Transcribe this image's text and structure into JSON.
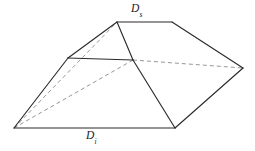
{
  "figure": {
    "kind": "truncated-pyramid-frustum-perspective",
    "background_color": "#ffffff",
    "solid_edge_color": "#2b2b2b",
    "hidden_edge_color": "#8a8a8a",
    "label_color": "#1a1a1a",
    "width": 255,
    "height": 151
  },
  "labels": {
    "top": {
      "base": "D",
      "subscript": "s",
      "full": "Ds",
      "meaning": "superior-top-diameter"
    },
    "bottom": {
      "base": "D",
      "subscript": "i",
      "full": "Di",
      "meaning": "inferior-bottom-diameter"
    }
  },
  "geometry": {
    "vertices": {
      "bottom_left": [
        14,
        128
      ],
      "bottom_right": [
        175,
        128
      ],
      "right_far": [
        243,
        68
      ],
      "left_mid": [
        68,
        58
      ],
      "center_junction": [
        133,
        60
      ],
      "top_left_apex": [
        117,
        22
      ],
      "top_right_apex": [
        172,
        22
      ]
    },
    "solid_edges": [
      {
        "name": "bottom-front-edge",
        "from": "bottom_left",
        "to": "bottom_right"
      },
      {
        "name": "bottom-right-edge",
        "from": "bottom_right",
        "to": "right_far"
      },
      {
        "name": "left-slope-edge",
        "from": "bottom_left",
        "to": "left_mid"
      },
      {
        "name": "left-top-ridge",
        "from": "left_mid",
        "to": "top_left_apex"
      },
      {
        "name": "top-edge",
        "from": "top_left_apex",
        "to": "top_right_apex"
      },
      {
        "name": "right-top-ridge",
        "from": "top_right_apex",
        "to": "right_far"
      },
      {
        "name": "mid-horizontal-edge",
        "from": "left_mid",
        "to": "center_junction"
      },
      {
        "name": "center-to-top-left",
        "from": "center_junction",
        "to": "top_left_apex"
      },
      {
        "name": "center-to-bottom-right",
        "from": "center_junction",
        "to": "bottom_right"
      }
    ],
    "hidden_edges": [
      {
        "name": "hidden-diagonal-to-apex",
        "from": "bottom_left",
        "to": "top_left_apex"
      },
      {
        "name": "hidden-diagonal-to-center",
        "from": "bottom_left",
        "to": "center_junction"
      },
      {
        "name": "hidden-back-horizontal",
        "from": "center_junction",
        "to": "right_far"
      }
    ]
  }
}
